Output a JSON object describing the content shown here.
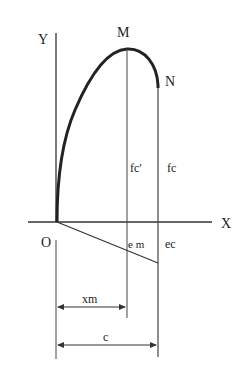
{
  "diagram": {
    "labels": {
      "y_axis": "Y",
      "x_axis": "X",
      "origin": "O",
      "peak": "M",
      "end": "N",
      "fc_prime": "fc′",
      "fc": "fc",
      "em": "e m",
      "ec": "ec",
      "xm": "xm",
      "c": "c"
    },
    "colors": {
      "stroke": "#222222",
      "background": "#ffffff"
    }
  }
}
